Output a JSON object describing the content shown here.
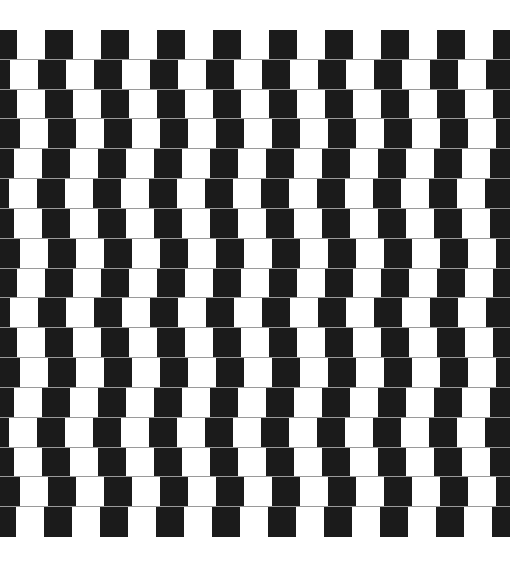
{
  "illusion": {
    "name": "Café wall illusion",
    "colors": {
      "background": "#ffffff",
      "tile": "#1b1b1b",
      "mortar": "#9a9a9a"
    },
    "wall": {
      "left": 0,
      "top": 30,
      "width": 510,
      "height": 507
    },
    "tile_width": 28,
    "period": 56,
    "row_count": 17,
    "row_offsets": [
      45,
      38,
      45,
      48,
      42,
      37,
      42,
      48,
      45,
      38,
      45,
      48,
      42,
      37,
      42,
      48,
      44
    ]
  }
}
